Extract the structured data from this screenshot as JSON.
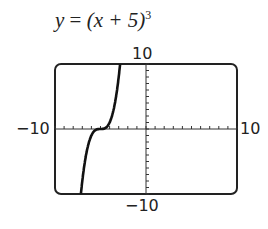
{
  "chart_data": {
    "type": "line",
    "equation": {
      "var": "y",
      "eq": " = ",
      "body": "(x + 5)",
      "exp": "3"
    },
    "xlim": [
      -10,
      10
    ],
    "ylim": [
      -10,
      10
    ],
    "xticks_step": 1,
    "yticks_step": 1,
    "window_labels": {
      "ymax": "10",
      "ymin": "−10",
      "xmin": "−10",
      "xmax": "10"
    },
    "series": [
      {
        "name": "(x+5)^3",
        "x": [
          -7.15,
          -7,
          -6.5,
          -6,
          -5.5,
          -5,
          -4.5,
          -4,
          -3.5,
          -2.85
        ],
        "y": [
          -9.94,
          -8,
          -3.375,
          -1,
          -0.125,
          0,
          0.125,
          1,
          3.375,
          9.94
        ]
      }
    ],
    "grid": false
  }
}
